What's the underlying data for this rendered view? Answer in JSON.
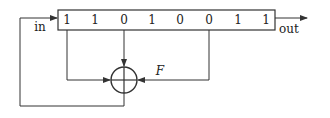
{
  "diagram": {
    "type": "linear-feedback-shift-register",
    "register": {
      "bits": [
        "1",
        "1",
        "0",
        "1",
        "0",
        "0",
        "1",
        "1"
      ],
      "taps": [
        1,
        3,
        6
      ]
    },
    "labels": {
      "input": "in",
      "output": "out",
      "feedback": "F"
    },
    "xor_symbol": "xor-circle-plus",
    "colors": {
      "line": "#333333",
      "background": "#ffffff"
    }
  }
}
